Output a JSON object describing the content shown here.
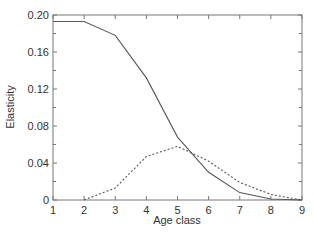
{
  "chart_data": {
    "type": "line",
    "title": "",
    "xlabel": "Age class",
    "ylabel": "Elasticity",
    "x": [
      1,
      2,
      3,
      4,
      5,
      6,
      7,
      8,
      9
    ],
    "xlim": [
      1,
      9
    ],
    "ylim": [
      0,
      0.2
    ],
    "xticks": [
      "1",
      "2",
      "3",
      "4",
      "5",
      "6",
      "7",
      "8",
      "9"
    ],
    "yticks": [
      "0",
      "0.04",
      "0.08",
      "0.12",
      "0.16",
      "0.20"
    ],
    "grid": false,
    "legend": null,
    "series": [
      {
        "name": "solid",
        "style": "solid",
        "values": [
          0.193,
          0.193,
          0.178,
          0.132,
          0.068,
          0.03,
          0.008,
          0.001,
          0.0
        ]
      },
      {
        "name": "dashed",
        "style": "dashed",
        "values": [
          null,
          0.0,
          0.013,
          0.047,
          0.058,
          0.042,
          0.019,
          0.006,
          0.0
        ]
      }
    ]
  },
  "colors": {
    "line": "#555555",
    "axis": "#777777",
    "text": "#333333"
  }
}
